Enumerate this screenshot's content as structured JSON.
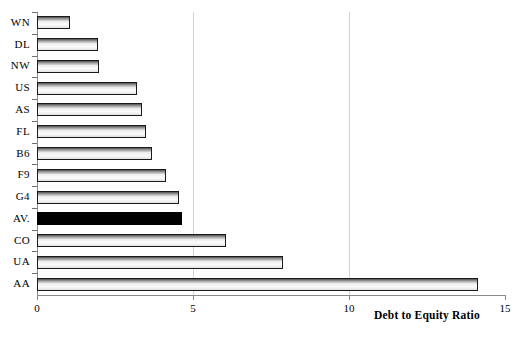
{
  "chart_data": {
    "type": "bar",
    "orientation": "horizontal",
    "title": "",
    "xlabel": "Debt to Equity Ratio",
    "ylabel": "",
    "xlim": [
      0,
      15
    ],
    "xticks": [
      0,
      5,
      10,
      15
    ],
    "xtick_labels": [
      "0",
      "5",
      "10",
      "15"
    ],
    "grid": true,
    "grid_axis": "x",
    "gridlines_at": [
      5,
      10
    ],
    "legend": null,
    "categories": [
      "WN",
      "DL",
      "NW",
      "US",
      "AS",
      "FL",
      "B6",
      "F9",
      "G4",
      "AV.",
      "CO",
      "UA",
      "AA"
    ],
    "values": [
      1.05,
      1.95,
      2.0,
      3.2,
      3.35,
      3.5,
      3.7,
      4.15,
      4.55,
      4.65,
      6.05,
      7.9,
      14.15
    ],
    "highlight_category": "AV.",
    "highlight_color": "#000000",
    "bar_color": "#efefef",
    "bar_edge_color": "#1a1a1a",
    "bars": [
      {
        "label": "WN",
        "value": 1.05,
        "highlight": false
      },
      {
        "label": "DL",
        "value": 1.95,
        "highlight": false
      },
      {
        "label": "NW",
        "value": 2.0,
        "highlight": false
      },
      {
        "label": "US",
        "value": 3.2,
        "highlight": false
      },
      {
        "label": "AS",
        "value": 3.35,
        "highlight": false
      },
      {
        "label": "FL",
        "value": 3.5,
        "highlight": false
      },
      {
        "label": "B6",
        "value": 3.7,
        "highlight": false
      },
      {
        "label": "F9",
        "value": 4.15,
        "highlight": false
      },
      {
        "label": "G4",
        "value": 4.55,
        "highlight": false
      },
      {
        "label": "AV.",
        "value": 4.65,
        "highlight": true
      },
      {
        "label": "CO",
        "value": 6.05,
        "highlight": false
      },
      {
        "label": "UA",
        "value": 7.9,
        "highlight": false
      },
      {
        "label": "AA",
        "value": 14.15,
        "highlight": false
      }
    ]
  }
}
